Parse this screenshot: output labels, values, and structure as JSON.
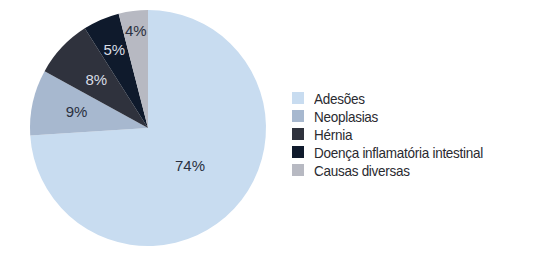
{
  "chart_data": {
    "type": "pie",
    "title": "",
    "start_angle_deg": 0,
    "direction": "clockwise",
    "slices": [
      {
        "label": "Adesões",
        "value": 74,
        "display": "74%",
        "color": "#c8dcf0",
        "text_color": "#2a3040"
      },
      {
        "label": "Neoplasias",
        "value": 9,
        "display": "9%",
        "color": "#a7b8cf",
        "text_color": "#2a3040"
      },
      {
        "label": "Hérnia",
        "value": 8,
        "display": "8%",
        "color": "#2f323d",
        "text_color": "#d8dde6"
      },
      {
        "label": "Doença inflamatória intestinal",
        "value": 5,
        "display": "5%",
        "color": "#0f1a2c",
        "text_color": "#d8dde6"
      },
      {
        "label": "Causas diversas",
        "value": 4,
        "display": "4%",
        "color": "#b7b9c2",
        "text_color": "#2a3040"
      }
    ],
    "legend_position": "right"
  },
  "legend": {
    "items": [
      {
        "label": "Adesões",
        "color": "#c8dcf0"
      },
      {
        "label": "Neoplasias",
        "color": "#a7b8cf"
      },
      {
        "label": "Hérnia",
        "color": "#2f323d"
      },
      {
        "label": "Doença inflamatória intestinal",
        "color": "#0f1a2c"
      },
      {
        "label": "Causas diversas",
        "color": "#b7b9c2"
      }
    ]
  }
}
